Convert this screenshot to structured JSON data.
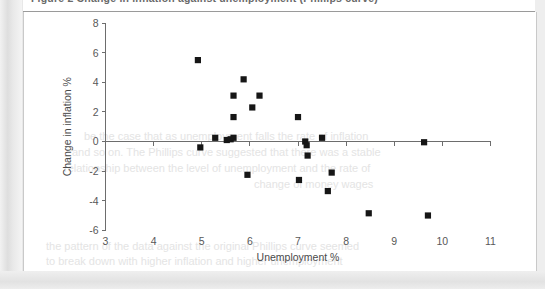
{
  "document": {
    "caption": "Figure 2  Change in inflation against unemployment (Phillips curve)",
    "ghost_lines": [
      "be the case that as unemployment falls the rate of inflation",
      "and so on. The Phillips curve suggested that there was a stable",
      "relationship between the level of unemployment and the rate of",
      "change of money wages",
      "the pattern of the data against the original Phillips curve seemed",
      "to break down with higher inflation and higher unemployment"
    ]
  },
  "chart_data": {
    "type": "scatter",
    "title": "",
    "xlabel": "Unemployment %",
    "ylabel": "Change in inflation %",
    "xlim": [
      3,
      11
    ],
    "ylim": [
      -6,
      8
    ],
    "xticks": [
      3,
      4,
      5,
      6,
      7,
      8,
      9,
      10,
      11
    ],
    "yticks": [
      8,
      6,
      4,
      2,
      0,
      -2,
      -4,
      -6
    ],
    "xtick_labels": [
      "3",
      "4",
      "5",
      "6",
      "7",
      "8",
      "9",
      "10",
      "11"
    ],
    "ytick_labels": [
      "8",
      "6",
      "4",
      "2",
      "0",
      "-2",
      "-4",
      "-6"
    ],
    "grid": false,
    "legend": false,
    "zero_line": true,
    "marker_shape": "square",
    "marker_color": "#161616",
    "points": [
      {
        "x": 4.92,
        "y": 5.5
      },
      {
        "x": 4.97,
        "y": -0.4
      },
      {
        "x": 5.28,
        "y": 0.25
      },
      {
        "x": 5.52,
        "y": 0.1
      },
      {
        "x": 5.6,
        "y": 0.15
      },
      {
        "x": 5.66,
        "y": 0.25
      },
      {
        "x": 5.66,
        "y": 1.65
      },
      {
        "x": 5.66,
        "y": 3.1
      },
      {
        "x": 5.87,
        "y": 4.2
      },
      {
        "x": 5.95,
        "y": -2.25
      },
      {
        "x": 6.05,
        "y": 2.3
      },
      {
        "x": 6.2,
        "y": 3.1
      },
      {
        "x": 7.0,
        "y": 1.65
      },
      {
        "x": 7.02,
        "y": -2.6
      },
      {
        "x": 7.15,
        "y": 0.0
      },
      {
        "x": 7.18,
        "y": -0.25
      },
      {
        "x": 7.2,
        "y": -0.95
      },
      {
        "x": 7.5,
        "y": 0.25
      },
      {
        "x": 7.62,
        "y": -3.35
      },
      {
        "x": 7.7,
        "y": -2.1
      },
      {
        "x": 8.47,
        "y": -4.85
      },
      {
        "x": 9.62,
        "y": -0.05
      },
      {
        "x": 9.7,
        "y": -5.0
      }
    ]
  }
}
